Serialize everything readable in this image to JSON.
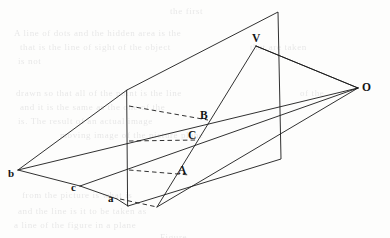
{
  "figure": {
    "background_color": "#fdfdfc",
    "ink_color": "#1a1a1a",
    "width": 390,
    "height": 238,
    "labels": {
      "eye_point": "O",
      "apex": "V",
      "image_top": "B",
      "image_middle": "C",
      "image_bottom": "A",
      "object_left": "b",
      "object_middle": "c",
      "object_right": "a"
    },
    "label_positions": {
      "eye_point": {
        "x": 362,
        "y": 82
      },
      "apex": {
        "x": 252,
        "y": 33
      },
      "image_top": {
        "x": 200,
        "y": 110
      },
      "image_middle": {
        "x": 188,
        "y": 130
      },
      "image_bottom": {
        "x": 178,
        "y": 165
      },
      "object_left": {
        "x": 8,
        "y": 168
      },
      "object_middle": {
        "x": 71,
        "y": 182
      },
      "object_right": {
        "x": 108,
        "y": 193
      }
    },
    "points": {
      "O": {
        "x": 358,
        "y": 88
      },
      "V": {
        "x": 256,
        "y": 46
      },
      "B": {
        "x": 208,
        "y": 120
      },
      "C": {
        "x": 197,
        "y": 140
      },
      "A": {
        "x": 190,
        "y": 175
      },
      "b": {
        "x": 18,
        "y": 170
      },
      "c": {
        "x": 80,
        "y": 186
      },
      "a": {
        "x": 117,
        "y": 199
      },
      "F": {
        "x": 157,
        "y": 207
      },
      "plane_top_left": {
        "x": 127,
        "y": 90
      },
      "plane_top_right": {
        "x": 278,
        "y": 12
      },
      "plane_bottom_right": {
        "x": 281,
        "y": 159
      },
      "plane_bottom_left": {
        "x": 128,
        "y": 206
      }
    },
    "elements": [
      {
        "name": "picture-plane-outline",
        "kind": "quadrilateral",
        "style": "solid"
      },
      {
        "name": "ray-O-to-b",
        "kind": "projection-ray",
        "style": "solid"
      },
      {
        "name": "ray-O-to-c",
        "kind": "projection-ray",
        "style": "solid"
      },
      {
        "name": "ray-O-to-a",
        "kind": "projection-ray",
        "style": "solid"
      },
      {
        "name": "ray-O-to-V",
        "kind": "projection-ray",
        "style": "solid"
      },
      {
        "name": "triangle-abc-edge-bc",
        "kind": "object-edge",
        "style": "solid"
      },
      {
        "name": "triangle-abc-edge-ca",
        "kind": "object-edge",
        "style": "solid"
      },
      {
        "name": "triangle-abc-edge-ab",
        "kind": "object-edge",
        "style": "solid"
      },
      {
        "name": "hidden-chord-b-to-B",
        "kind": "correspondence",
        "style": "dashed"
      },
      {
        "name": "hidden-chord-c-to-C",
        "kind": "correspondence",
        "style": "dashed"
      },
      {
        "name": "hidden-chord-a-to-F",
        "kind": "correspondence",
        "style": "dashed"
      },
      {
        "name": "image-edge-V-to-F",
        "kind": "image-edge",
        "style": "solid"
      },
      {
        "name": "image-edge-V-to-O",
        "kind": "image-edge",
        "style": "solid"
      }
    ]
  },
  "bleed_text": [
    {
      "x": 170,
      "y": 6,
      "text": "the first"
    },
    {
      "x": 14,
      "y": 28,
      "text": "A line of dots and the hidden area is the"
    },
    {
      "x": 20,
      "y": 42,
      "text": "that is the line of sight of the object"
    },
    {
      "x": 250,
      "y": 42,
      "text": "that are taken"
    },
    {
      "x": 18,
      "y": 56,
      "text": "is not"
    },
    {
      "x": 16,
      "y": 88,
      "text": "drawn so that all of the point is the line"
    },
    {
      "x": 20,
      "y": 102,
      "text": "and it is the same as the one of the"
    },
    {
      "x": 300,
      "y": 88,
      "text": "of the"
    },
    {
      "x": 18,
      "y": 116,
      "text": "is. The result of an actual image"
    },
    {
      "x": 60,
      "y": 130,
      "text": "moving image of the picture plane"
    },
    {
      "x": 22,
      "y": 190,
      "text": "from the picture is what is"
    },
    {
      "x": 18,
      "y": 206,
      "text": "and the line is it to be taken as"
    },
    {
      "x": 14,
      "y": 220,
      "text": "a line of the figure in a plane"
    },
    {
      "x": 160,
      "y": 232,
      "text": "Figure"
    }
  ]
}
